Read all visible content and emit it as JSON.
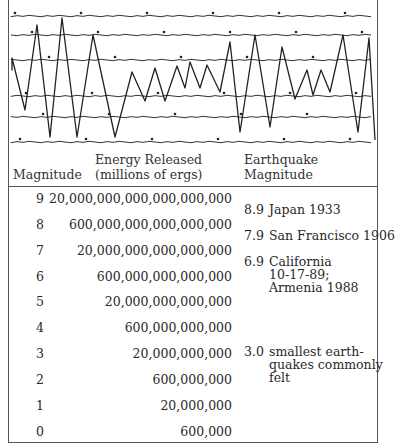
{
  "seismograph": {
    "baselines_y": [
      16,
      35,
      60,
      96,
      117,
      142
    ],
    "trace_points": [
      [
        3,
        58
      ],
      [
        3,
        70
      ],
      [
        3,
        58
      ],
      [
        16,
        110
      ],
      [
        28,
        25
      ],
      [
        41,
        137
      ],
      [
        53,
        18
      ],
      [
        68,
        137
      ],
      [
        84,
        35
      ],
      [
        106,
        137
      ],
      [
        123,
        72
      ],
      [
        136,
        101
      ],
      [
        146,
        68
      ],
      [
        156,
        101
      ],
      [
        168,
        66
      ],
      [
        176,
        88
      ],
      [
        181,
        62
      ],
      [
        191,
        88
      ],
      [
        198,
        65
      ],
      [
        211,
        92
      ],
      [
        221,
        42
      ],
      [
        231,
        132
      ],
      [
        246,
        35
      ],
      [
        261,
        127
      ],
      [
        273,
        47
      ],
      [
        286,
        99
      ],
      [
        298,
        70
      ],
      [
        304,
        95
      ],
      [
        312,
        70
      ],
      [
        321,
        92
      ],
      [
        334,
        35
      ],
      [
        349,
        132
      ],
      [
        360,
        38
      ],
      [
        366,
        140
      ]
    ],
    "trace_color": "#222222"
  },
  "table": {
    "headers": {
      "magnitude": "Magnitude",
      "energy_line1": "Energy Released",
      "energy_line2": "(millions of ergs)",
      "quake_line1": "Earthquake",
      "quake_line2": "Magnitude"
    },
    "rows": [
      {
        "magnitude": "9",
        "energy": "20,000,000,000,000,000,000"
      },
      {
        "magnitude": "8",
        "energy": "600,000,000,000,000,000"
      },
      {
        "magnitude": "7",
        "energy": "20,000,000,000,000,000"
      },
      {
        "magnitude": "6",
        "energy": "600,000,000,000,000"
      },
      {
        "magnitude": "5",
        "energy": "20,000,000,000,000"
      },
      {
        "magnitude": "4",
        "energy": "600,000,000,000"
      },
      {
        "magnitude": "3",
        "energy": "20,000,000,000"
      },
      {
        "magnitude": "2",
        "energy": "600,000,000"
      },
      {
        "magnitude": "1",
        "energy": "20,000,000"
      },
      {
        "magnitude": "0",
        "energy": "600,000"
      }
    ],
    "examples": [
      {
        "value": "8.9",
        "lines": [
          "Japan 1933"
        ]
      },
      {
        "value": "7.9",
        "lines": [
          "San Francisco 1906"
        ]
      },
      {
        "value": "6.9",
        "lines": [
          "California",
          "10-17-89;",
          "Armenia 1988"
        ]
      },
      {
        "value": "3.0",
        "lines": [
          "smallest earth-",
          "quakes commonly",
          "felt"
        ]
      }
    ]
  }
}
